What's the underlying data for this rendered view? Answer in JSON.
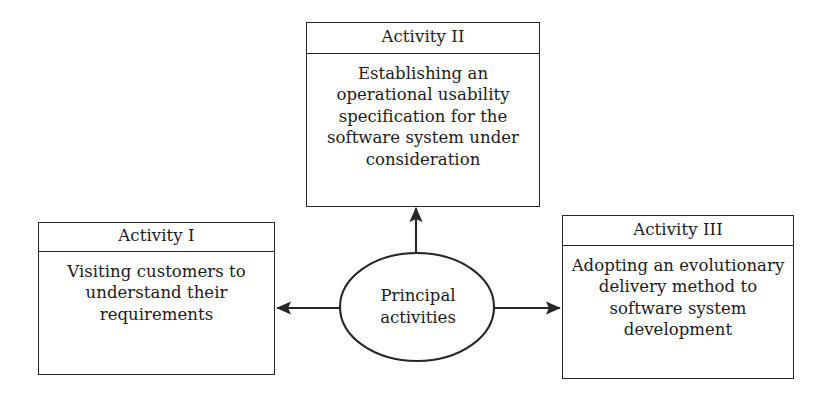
{
  "diagram": {
    "title": "Principal activities",
    "background_color": "#ffffff",
    "stroke_color": "#262626",
    "text_color": "#1a1a1a",
    "hub": {
      "label_line_1": "Principal",
      "label_line_2": "activities",
      "shape": "ellipse"
    },
    "nodes": [
      {
        "id": "activity-1",
        "title": "Activity I",
        "body": "Visiting customers to understand their requirements",
        "position": "left"
      },
      {
        "id": "activity-2",
        "title": "Activity II",
        "body": "Establishing an operational usability specification for the software system under consideration",
        "position": "top"
      },
      {
        "id": "activity-3",
        "title": "Activity III",
        "body": "Adopting an evolutionary delivery method to software system development",
        "position": "right"
      }
    ],
    "connectors": [
      {
        "from": "hub",
        "to": "activity-1",
        "direction": "left",
        "arrowhead": "single"
      },
      {
        "from": "hub",
        "to": "activity-2",
        "direction": "up",
        "arrowhead": "single"
      },
      {
        "from": "hub",
        "to": "activity-3",
        "direction": "right",
        "arrowhead": "single"
      }
    ]
  }
}
